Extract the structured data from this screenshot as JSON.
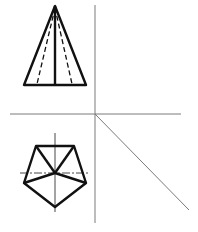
{
  "figure": {
    "colors": {
      "line": "#111111",
      "axis": "#7a7a7a",
      "background": "#ffffff"
    },
    "axes": {
      "vertical": {
        "x": 95,
        "y1": 5,
        "y2": 223
      },
      "horizontal": {
        "y": 114,
        "x1": 10,
        "x2": 181
      },
      "miter": {
        "x1": 95,
        "y1": 114,
        "x2": 189,
        "y2": 210
      }
    },
    "front_view": {
      "apex": [
        55,
        6
      ],
      "base_left": [
        24,
        85
      ],
      "base_right": [
        86,
        85
      ],
      "center_edge_base": [
        55,
        85
      ],
      "hidden_edges_base": [
        [
          37,
          85
        ],
        [
          72,
          85
        ]
      ]
    },
    "top_view": {
      "center": [
        55,
        173
      ],
      "vertices": [
        [
          36,
          146
        ],
        [
          74,
          146
        ],
        [
          86,
          183
        ],
        [
          55,
          207
        ],
        [
          24,
          183
        ]
      ],
      "center_line_vertical": {
        "x": 55,
        "y1": 133,
        "y2": 212
      },
      "center_line_horizontal": {
        "y": 173,
        "x1": 20,
        "x2": 88
      }
    }
  }
}
